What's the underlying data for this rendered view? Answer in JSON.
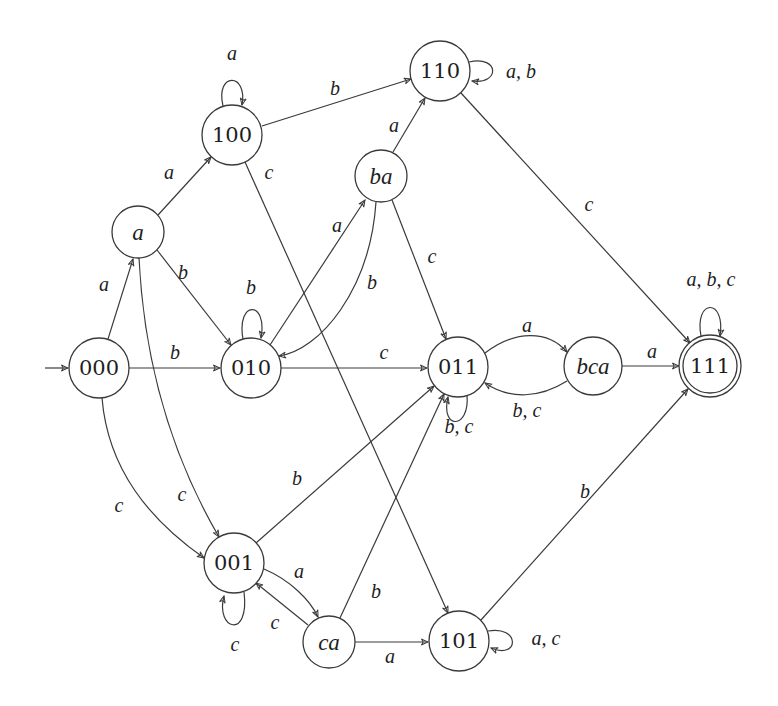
{
  "diagram": {
    "type": "finite-automaton",
    "colors": {
      "stroke": "#3a3a3a",
      "text": "#1e1e1e",
      "background": "#ffffff"
    },
    "initial_state": "000",
    "accepting_states": [
      "111"
    ],
    "states": [
      {
        "id": "000",
        "label": "000",
        "italic": false,
        "x": 99,
        "y": 368,
        "r": 30
      },
      {
        "id": "a",
        "label": "a",
        "italic": true,
        "x": 138,
        "y": 232,
        "r": 26
      },
      {
        "id": "100",
        "label": "100",
        "italic": false,
        "x": 232,
        "y": 135,
        "r": 30
      },
      {
        "id": "110",
        "label": "110",
        "italic": false,
        "x": 440,
        "y": 71,
        "r": 30
      },
      {
        "id": "ba",
        "label": "ba",
        "italic": true,
        "x": 381,
        "y": 176,
        "r": 26
      },
      {
        "id": "010",
        "label": "010",
        "italic": false,
        "x": 251,
        "y": 368,
        "r": 30
      },
      {
        "id": "011",
        "label": "011",
        "italic": false,
        "x": 458,
        "y": 367,
        "r": 30
      },
      {
        "id": "bca",
        "label": "bca",
        "italic": true,
        "x": 593,
        "y": 366,
        "r": 29
      },
      {
        "id": "111",
        "label": "111",
        "italic": false,
        "x": 710,
        "y": 366,
        "r": 31,
        "accepting": true
      },
      {
        "id": "001",
        "label": "001",
        "italic": false,
        "x": 234,
        "y": 563,
        "r": 30
      },
      {
        "id": "ca",
        "label": "ca",
        "italic": true,
        "x": 329,
        "y": 642,
        "r": 26
      },
      {
        "id": "101",
        "label": "101",
        "italic": false,
        "x": 459,
        "y": 641,
        "r": 30
      }
    ],
    "transitions": [
      {
        "from": "000",
        "to": "a",
        "label": "a",
        "path": "M108,339 L133,259",
        "lx": 104,
        "ly": 284
      },
      {
        "from": "000",
        "to": "010",
        "label": "b",
        "path": "M129,368 L220,368",
        "lx": 175,
        "ly": 352
      },
      {
        "from": "000",
        "to": "001",
        "label": "c",
        "path": "M102,398 C108,470 150,520 204,558",
        "lx": 119,
        "ly": 505
      },
      {
        "from": "a",
        "to": "100",
        "label": "a",
        "path": "M158,215 L211,157",
        "lx": 169,
        "ly": 172
      },
      {
        "from": "a",
        "to": "010",
        "label": "b",
        "path": "M157,250 L231,345",
        "lx": 183,
        "ly": 272
      },
      {
        "from": "a",
        "to": "001",
        "label": "c",
        "path": "M139,258 C145,380 180,470 219,537",
        "lx": 182,
        "ly": 494
      },
      {
        "from": "100",
        "to": "100",
        "label": "a",
        "path": "M223,106 C215,72 248,72 242,105",
        "lx": 232,
        "ly": 53
      },
      {
        "from": "100",
        "to": "110",
        "label": "b",
        "path": "M262,126 L411,79",
        "lx": 335,
        "ly": 88
      },
      {
        "from": "100",
        "to": "101",
        "label": "c",
        "path": "M245,162 L448,613",
        "lx": 269,
        "ly": 172
      },
      {
        "from": "110",
        "to": "110",
        "label": "a, b",
        "path": "M469,62 C500,55 500,85 472,81",
        "lx": 521,
        "ly": 71
      },
      {
        "from": "110",
        "to": "111",
        "label": "c",
        "path": "M461,93 L690,343",
        "lx": 589,
        "ly": 204
      },
      {
        "from": "ba",
        "to": "110",
        "label": "a",
        "path": "M393,152 L425,98",
        "lx": 394,
        "ly": 125
      },
      {
        "from": "ba",
        "to": "010",
        "label": "b",
        "path": "M376,202 C370,290 320,350 279,356",
        "lx": 372,
        "ly": 282
      },
      {
        "from": "ba",
        "to": "011",
        "label": "c",
        "path": "M392,200 L446,339",
        "lx": 432,
        "ly": 256
      },
      {
        "from": "010",
        "to": "010",
        "label": "b",
        "path": "M243,339 C236,300 268,300 261,338",
        "lx": 251,
        "ly": 287
      },
      {
        "from": "010",
        "to": "ba",
        "label": "a",
        "path": "M270,345 L365,200",
        "lx": 337,
        "ly": 225
      },
      {
        "from": "010",
        "to": "011",
        "label": "c",
        "path": "M281,368 L427,368",
        "lx": 384,
        "ly": 352
      },
      {
        "from": "011",
        "to": "bca",
        "label": "a",
        "path": "M485,353 C515,330 548,330 567,352",
        "lx": 527,
        "ly": 325
      },
      {
        "from": "011",
        "to": "011",
        "label": "b, c",
        "path": "M467,395 C470,430 440,430 448,397",
        "lx": 459,
        "ly": 426
      },
      {
        "from": "bca",
        "to": "011",
        "label": "b, c",
        "path": "M567,381 C540,398 510,400 485,383",
        "lx": 527,
        "ly": 410
      },
      {
        "from": "bca",
        "to": "111",
        "label": "a",
        "path": "M622,366 L679,366",
        "lx": 652,
        "ly": 351
      },
      {
        "from": "111",
        "to": "111",
        "label": "a, b, c",
        "path": "M701,336 C694,298 726,298 720,336",
        "lx": 711,
        "ly": 279
      },
      {
        "from": "001",
        "to": "011",
        "label": "b",
        "path": "M256,543 L434,386",
        "lx": 297,
        "ly": 478
      },
      {
        "from": "001",
        "to": "001",
        "label": "c",
        "path": "M244,592 C250,640 215,630 224,596",
        "lx": 235,
        "ly": 644
      },
      {
        "from": "001",
        "to": "ca",
        "label": "a",
        "path": "M264,569 C290,580 310,600 318,617",
        "lx": 299,
        "ly": 571
      },
      {
        "from": "ca",
        "to": "001",
        "label": "c",
        "path": "M308,625 L256,583",
        "lx": 275,
        "ly": 622
      },
      {
        "from": "ca",
        "to": "011",
        "label": "b",
        "path": "M340,618 L444,394",
        "lx": 376,
        "ly": 591
      },
      {
        "from": "ca",
        "to": "101",
        "label": "a",
        "path": "M355,642 L428,642",
        "lx": 390,
        "ly": 656
      },
      {
        "from": "101",
        "to": "101",
        "label": "a, c",
        "path": "M488,631 C520,625 520,660 491,648",
        "lx": 546,
        "ly": 638
      },
      {
        "from": "101",
        "to": "111",
        "label": "b",
        "path": "M481,620 L688,389",
        "lx": 585,
        "ly": 491
      }
    ],
    "initial_arrow": {
      "path": "M45,368 L68,368"
    }
  }
}
